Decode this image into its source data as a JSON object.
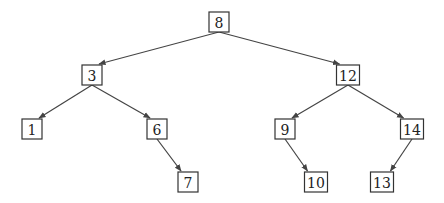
{
  "diagram": {
    "type": "binary-search-tree",
    "root": "8",
    "nodes": [
      {
        "id": "n8",
        "label": "8"
      },
      {
        "id": "n3",
        "label": "3"
      },
      {
        "id": "n12",
        "label": "12"
      },
      {
        "id": "n1",
        "label": "1"
      },
      {
        "id": "n6",
        "label": "6"
      },
      {
        "id": "n9",
        "label": "9"
      },
      {
        "id": "n14",
        "label": "14"
      },
      {
        "id": "n7",
        "label": "7"
      },
      {
        "id": "n10",
        "label": "10"
      },
      {
        "id": "n13",
        "label": "13"
      }
    ],
    "edges": [
      {
        "from": "n8",
        "to": "n3"
      },
      {
        "from": "n8",
        "to": "n12"
      },
      {
        "from": "n3",
        "to": "n1"
      },
      {
        "from": "n3",
        "to": "n6"
      },
      {
        "from": "n6",
        "to": "n7"
      },
      {
        "from": "n12",
        "to": "n9"
      },
      {
        "from": "n12",
        "to": "n14"
      },
      {
        "from": "n9",
        "to": "n10"
      },
      {
        "from": "n14",
        "to": "n13"
      }
    ]
  }
}
